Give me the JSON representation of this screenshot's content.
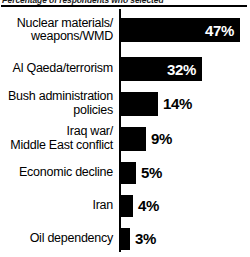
{
  "header": {
    "caption": "Percentage of respondents who selected"
  },
  "chart_data": {
    "type": "bar",
    "orientation": "horizontal",
    "title": "Percentage of respondents who selected",
    "xlabel": "",
    "ylabel": "",
    "xlim": [
      0,
      50
    ],
    "grid": false,
    "legend": false,
    "bar_color": "#000000",
    "categories": [
      "Nuclear materials/\nweapons/WMD",
      "Al Qaeda/terrorism",
      "Bush administration\npolicies",
      "Iraq war/\nMiddle East conflict",
      "Economic decline",
      "Iran",
      "Oil dependency"
    ],
    "values": [
      47,
      32,
      14,
      9,
      5,
      4,
      3
    ],
    "value_labels": [
      "47%",
      "32%",
      "14%",
      "9%",
      "5%",
      "4%",
      "3%"
    ],
    "label_placement": [
      "inside",
      "inside",
      "outside",
      "outside",
      "outside",
      "outside",
      "outside"
    ]
  },
  "rows": [
    {
      "label": "Nuclear materials/\nweapons/WMD",
      "value": 47,
      "value_label": "47%",
      "placement": "inside",
      "bar_px": 119,
      "row_h": 42
    },
    {
      "label": "Al Qaeda/terrorism",
      "value": 32,
      "value_label": "32%",
      "placement": "inside",
      "bar_px": 81,
      "row_h": 35
    },
    {
      "label": "Bush administration\npolicies",
      "value": 14,
      "value_label": "14%",
      "placement": "outside",
      "bar_px": 37,
      "row_h": 35
    },
    {
      "label": "Iraq war/\nMiddle East conflict",
      "value": 9,
      "value_label": "9%",
      "placement": "outside",
      "bar_px": 25,
      "row_h": 35
    },
    {
      "label": "Economic decline",
      "value": 5,
      "value_label": "5%",
      "placement": "outside",
      "bar_px": 15,
      "row_h": 33
    },
    {
      "label": "Iran",
      "value": 4,
      "value_label": "4%",
      "placement": "outside",
      "bar_px": 12,
      "row_h": 33
    },
    {
      "label": "Oil dependency",
      "value": 3,
      "value_label": "3%",
      "placement": "outside",
      "bar_px": 9,
      "row_h": 33
    }
  ]
}
